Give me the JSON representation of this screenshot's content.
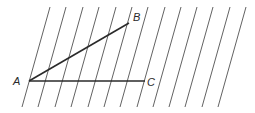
{
  "diagram": {
    "points": {
      "A": {
        "label": "A",
        "x": 29,
        "y": 81,
        "label_x": 13,
        "label_y": 85
      },
      "B": {
        "label": "B",
        "x": 129,
        "y": 23,
        "label_x": 133,
        "label_y": 21
      },
      "C": {
        "label": "C",
        "x": 145,
        "y": 81,
        "label_x": 147,
        "label_y": 86
      }
    },
    "segments": [
      {
        "name": "segment-AB",
        "from": "A",
        "to": "B"
      },
      {
        "name": "segment-AC",
        "from": "A",
        "to": "C"
      }
    ],
    "parallel_lines": {
      "count": 13,
      "top_y": 7,
      "bottom_y": 107,
      "bottom_x": [
        22,
        38,
        55,
        71,
        88,
        104,
        120,
        137,
        153,
        169,
        185,
        202,
        218
      ],
      "slope_dx": 28
    },
    "colors": {
      "line": "#3a3a3a",
      "side": "#2a2a2a",
      "background": "#ffffff"
    }
  }
}
